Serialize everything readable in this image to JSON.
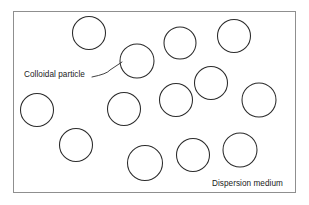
{
  "figure": {
    "background_color": "#ffffff",
    "frame": {
      "name": "dispersion-medium-frame",
      "x": 13,
      "y": 11,
      "width": 283,
      "height": 182,
      "stroke_color": "#8f8f8f",
      "fill_color": "#ffffff",
      "stroke_width": 1
    },
    "labels": {
      "colloidal_particle": "Colloidal particle",
      "dispersion_medium": "Dispersion medium"
    },
    "leader_line": {
      "name": "colloidal-particle-leader-line",
      "x1": 92,
      "y1": 77,
      "x2": 106,
      "y2": 73,
      "x3": 122,
      "y3": 62,
      "stroke_color": "#2b2b2b"
    },
    "particle_style": {
      "stroke_color": "#2b2b2b",
      "fill": "none",
      "stroke_width": 1.05
    },
    "particles": [
      {
        "id": 1,
        "cx": 89,
        "cy": 33,
        "r": 16.5
      },
      {
        "id": 2,
        "cx": 137,
        "cy": 61,
        "r": 17.0
      },
      {
        "id": 3,
        "cx": 180,
        "cy": 43,
        "r": 16.0
      },
      {
        "id": 4,
        "cx": 234,
        "cy": 36,
        "r": 16.5
      },
      {
        "id": 5,
        "cx": 211,
        "cy": 83,
        "r": 16.5
      },
      {
        "id": 6,
        "cx": 176,
        "cy": 100,
        "r": 16.5
      },
      {
        "id": 7,
        "cx": 259,
        "cy": 100,
        "r": 17.0
      },
      {
        "id": 8,
        "cx": 37,
        "cy": 110,
        "r": 16.5
      },
      {
        "id": 9,
        "cx": 124,
        "cy": 109,
        "r": 16.5
      },
      {
        "id": 10,
        "cx": 76,
        "cy": 145,
        "r": 16.5
      },
      {
        "id": 11,
        "cx": 145,
        "cy": 163,
        "r": 17.5
      },
      {
        "id": 12,
        "cx": 193,
        "cy": 155,
        "r": 16.5
      },
      {
        "id": 13,
        "cx": 240,
        "cy": 150,
        "r": 17.0
      }
    ]
  }
}
